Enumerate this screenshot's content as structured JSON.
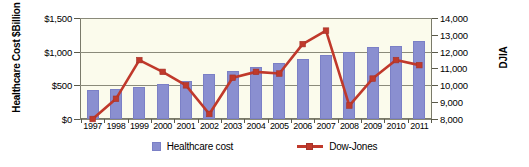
{
  "chart_data": {
    "type": "bar",
    "title": "",
    "xlabel": "",
    "categories": [
      "1997",
      "1998",
      "1999",
      "2000",
      "2001",
      "2002",
      "2003",
      "2004",
      "2005",
      "2006",
      "2007",
      "2008",
      "2009",
      "2010",
      "2011"
    ],
    "grid": true,
    "legend_position": "bottom",
    "series": [
      {
        "name": "Healthcare cost",
        "type": "bar",
        "axis": "left",
        "color": "#8A8FD0",
        "values": [
          430,
          440,
          470,
          520,
          570,
          670,
          720,
          770,
          830,
          890,
          950,
          1000,
          1070,
          1090,
          1160
        ]
      },
      {
        "name": "Dow-Jones",
        "type": "line",
        "axis": "right",
        "color": "#C0392B",
        "values": [
          8000,
          9200,
          11500,
          10800,
          10000,
          8300,
          10450,
          10800,
          10700,
          12450,
          13250,
          8800,
          10400,
          11500,
          11200
        ]
      }
    ],
    "left_axis": {
      "label": "Healthcare Cost $Billion",
      "ticks": [
        "$0",
        "$500",
        "$1,000",
        "$1,500"
      ],
      "tick_values": [
        0,
        500,
        1000,
        1500
      ],
      "ylim": [
        0,
        1500
      ]
    },
    "right_axis": {
      "label": "DJIA",
      "ticks": [
        "8,000",
        "9,000",
        "10,000",
        "11,000",
        "12,000",
        "13,000",
        "14,000"
      ],
      "tick_values": [
        8000,
        9000,
        10000,
        11000,
        12000,
        13000,
        14000
      ],
      "ylim": [
        8000,
        14000
      ]
    },
    "legend": [
      {
        "label": "Healthcare cost",
        "marker": "square-swatch",
        "color": "#8A8FD0"
      },
      {
        "label": "Dow-Jones",
        "marker": "line-square",
        "color": "#C0392B"
      }
    ]
  }
}
